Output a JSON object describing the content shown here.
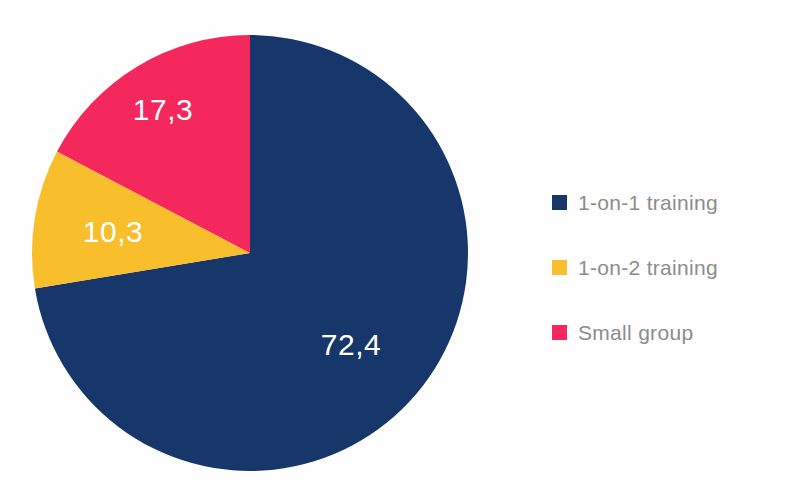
{
  "chart_data": {
    "type": "pie",
    "title": "",
    "categories": [
      "1-on-1 training",
      "1-on-2 training",
      "Small group"
    ],
    "values": [
      72.4,
      10.3,
      17.3
    ],
    "value_labels": [
      "72,4",
      "10,3",
      "17,3"
    ],
    "colors": [
      "#17376b",
      "#f8be2c",
      "#f4285c"
    ],
    "decimal_separator": ",",
    "start_angle_deg": 0,
    "direction": "clockwise",
    "legend": {
      "position": "right",
      "entries": [
        {
          "label": "1-on-1 training",
          "color": "#17376b",
          "value": 72.4
        },
        {
          "label": "1-on-2 training",
          "color": "#f8be2c",
          "value": 10.3
        },
        {
          "label": "Small group",
          "color": "#f4285c",
          "value": 17.3
        }
      ]
    },
    "label_color": "#ffffff",
    "legend_text_color": "#8c8c8c",
    "background": "#ffffff",
    "grid": false,
    "xlabel": "",
    "ylabel": ""
  },
  "slices": {
    "navy": {
      "label": "72,4",
      "name": "1-on-1 training"
    },
    "yellow": {
      "label": "10,3",
      "name": "1-on-2 training"
    },
    "pink": {
      "label": "17,3",
      "name": "Small group"
    }
  },
  "legend": {
    "items": [
      {
        "label": "1-on-1 training"
      },
      {
        "label": "1-on-2 training"
      },
      {
        "label": "Small group"
      }
    ]
  },
  "clipped_title": ""
}
